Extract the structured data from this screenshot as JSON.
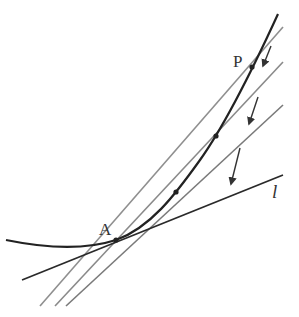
{
  "diagram": {
    "labels": {
      "point_a": "A",
      "point_p": "P",
      "tangent": "l"
    },
    "colors": {
      "curve": "#222222",
      "tangent": "#2a2a2a",
      "secant": "#8a8a8a",
      "secant_dark": "#555555",
      "arrow": "#333333",
      "label": "#333333"
    },
    "points": {
      "A": [
        116,
        240
      ],
      "P": [
        252,
        67
      ],
      "intermediate": [
        [
          216,
          136
        ],
        [
          176,
          192
        ]
      ]
    },
    "lines": {
      "tangent_l": [
        [
          22,
          280
        ],
        [
          283,
          175
        ]
      ],
      "secants": [
        [
          [
            40,
            306
          ],
          [
            283,
            27
          ]
        ],
        [
          [
            55,
            306
          ],
          [
            283,
            62
          ]
        ],
        [
          [
            66,
            306
          ],
          [
            283,
            105
          ]
        ]
      ]
    },
    "arrows": [
      [
        [
          271,
          46
        ],
        [
          263,
          66
        ]
      ],
      [
        [
          258,
          97
        ],
        [
          249,
          124
        ]
      ],
      [
        [
          240,
          148
        ],
        [
          231,
          184
        ]
      ]
    ]
  }
}
